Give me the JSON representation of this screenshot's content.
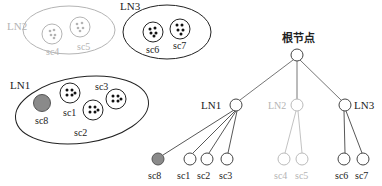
{
  "colors": {
    "dark": "#222222",
    "faded": "#b4b4b4",
    "filled": "#8a8a8a"
  },
  "left_panel": {
    "clusters": [
      {
        "id": "LN2",
        "label": "LN2",
        "faded": true,
        "members": [
          {
            "id": "sc4",
            "label": "sc4"
          },
          {
            "id": "sc5",
            "label": "sc5"
          }
        ]
      },
      {
        "id": "LN3",
        "label": "LN3",
        "faded": false,
        "members": [
          {
            "id": "sc6",
            "label": "sc6"
          },
          {
            "id": "sc7",
            "label": "sc7"
          }
        ]
      },
      {
        "id": "LN1",
        "label": "LN1",
        "faded": false,
        "members": [
          {
            "id": "sc8",
            "label": "sc8",
            "filled": true
          },
          {
            "id": "sc1",
            "label": "sc1"
          },
          {
            "id": "sc2",
            "label": "sc2"
          },
          {
            "id": "sc3",
            "label": "sc3"
          }
        ]
      }
    ]
  },
  "tree": {
    "root": {
      "label": "根节点"
    },
    "level1": [
      {
        "label": "LN1",
        "faded": false
      },
      {
        "label": "LN2",
        "faded": true
      },
      {
        "label": "LN3",
        "faded": false
      }
    ],
    "leaves": [
      {
        "label": "sc8",
        "parent": "LN1",
        "filled": true
      },
      {
        "label": "sc1",
        "parent": "LN1"
      },
      {
        "label": "sc2",
        "parent": "LN1"
      },
      {
        "label": "sc3",
        "parent": "LN1"
      },
      {
        "label": "sc4",
        "parent": "LN2",
        "faded": true
      },
      {
        "label": "sc5",
        "parent": "LN2",
        "faded": true
      },
      {
        "label": "sc6",
        "parent": "LN3"
      },
      {
        "label": "sc7",
        "parent": "LN3"
      }
    ]
  }
}
